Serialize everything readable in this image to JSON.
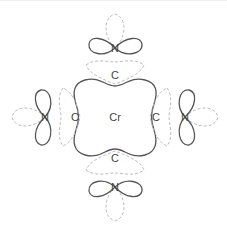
{
  "diagram": {
    "title": "",
    "colors": {
      "solid_stroke": "#555555",
      "dashed_stroke": "#bdbdbd",
      "label": "#444444",
      "background": "#ffffff"
    },
    "center": {
      "label": "Cr",
      "x": 115,
      "y": 117
    },
    "carbons": [
      {
        "position": "top",
        "label": "C",
        "x": 115,
        "y": 75
      },
      {
        "position": "left",
        "label": "C",
        "x": 75,
        "y": 117
      },
      {
        "position": "right",
        "label": "C",
        "x": 156,
        "y": 117
      },
      {
        "position": "bottom",
        "label": "C",
        "x": 115,
        "y": 158
      }
    ],
    "nitrogens": [
      {
        "position": "top",
        "label": "N",
        "x": 115,
        "y": 48
      },
      {
        "position": "left",
        "label": "N",
        "x": 45,
        "y": 117
      },
      {
        "position": "right",
        "label": "N",
        "x": 185,
        "y": 117
      },
      {
        "position": "bottom",
        "label": "N",
        "x": 115,
        "y": 187
      }
    ],
    "legend": {
      "solid_line": "filled orbital lobes",
      "dashed_line": "ligand / lone-pair lobes"
    }
  }
}
